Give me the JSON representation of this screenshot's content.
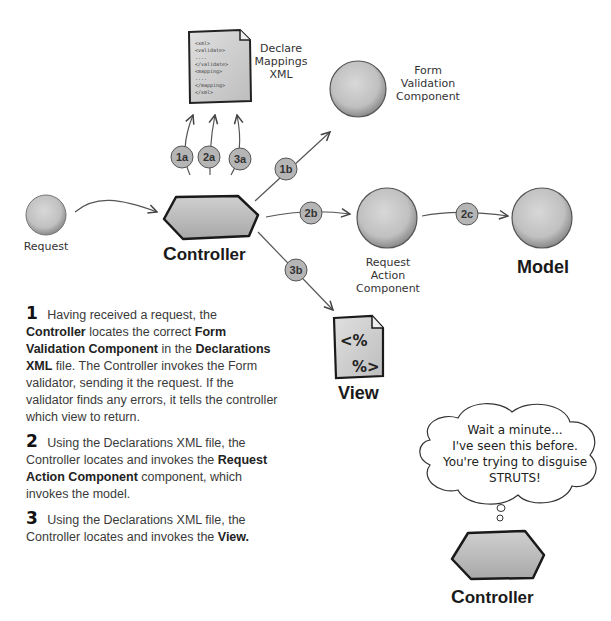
{
  "diagram": {
    "nodes": {
      "xml_doc": {
        "label_lines": [
          "Declare",
          "Mappings",
          "XML"
        ],
        "content_lines": [
          "<xml>",
          "<validate>",
          "....",
          "</validate>",
          "<mapping>",
          "....",
          "</mapping>",
          "</xml>"
        ]
      },
      "form_validation": {
        "label_lines": [
          "Form",
          "Validation",
          "Component"
        ]
      },
      "request": {
        "label": "Request"
      },
      "controller": {
        "label_first": "C",
        "label_rest": "ontroller"
      },
      "request_action": {
        "label_lines": [
          "Request",
          "Action",
          "Component"
        ]
      },
      "model": {
        "label": "Model"
      },
      "view": {
        "label": "View",
        "glyph_top": "<%",
        "glyph_bottom": "%>"
      }
    },
    "badges": {
      "b1a": "1a",
      "b2a": "2a",
      "b3a": "3a",
      "b1b": "1b",
      "b2b": "2b",
      "b3b": "3b",
      "b2c": "2c"
    }
  },
  "steps": [
    {
      "number": "1",
      "segments": [
        {
          "text": " Having received a request, the ",
          "bold": false
        },
        {
          "text": "Controller",
          "bold": true
        },
        {
          "text": " locates the correct ",
          "bold": false
        },
        {
          "text": "Form Validation Component",
          "bold": true
        },
        {
          "text": " in the ",
          "bold": false
        },
        {
          "text": "Declarations XML",
          "bold": true
        },
        {
          "text": " file. The Controller invokes the Form validator, sending  it the request.  If the validator finds any errors, it tells the controller which view to return.",
          "bold": false
        }
      ]
    },
    {
      "number": "2",
      "segments": [
        {
          "text": " Using the Declarations XML file, the Controller locates and invokes the ",
          "bold": false
        },
        {
          "text": "Request Action Component",
          "bold": true
        },
        {
          "text": " component, which invokes the model.",
          "bold": false
        }
      ]
    },
    {
      "number": "3",
      "segments": [
        {
          "text": " Using the Declarations XML file, the Controller locates and invokes the ",
          "bold": false
        },
        {
          "text": "View.",
          "bold": true
        }
      ]
    }
  ],
  "thought_bubble": {
    "lines": [
      "Wait a minute...",
      "I've seen this before.",
      "You're trying to disguise",
      "STRUTS!"
    ]
  },
  "bottom_controller": {
    "label_first": "C",
    "label_rest": "ontroller"
  },
  "colors": {
    "node_fill": "#c8c8c8",
    "node_stroke": "#2a2a2a",
    "badge_fill": "#b5b5b5",
    "arrow": "#555555"
  }
}
